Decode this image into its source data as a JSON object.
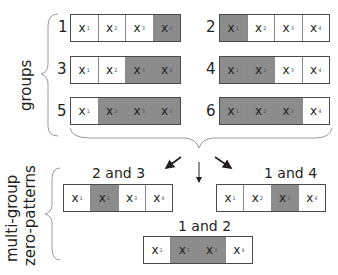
{
  "colors": {
    "zero_cell": "#8c8c8c",
    "nonzero_cell": "#ffffff",
    "border": "#4a4a4a",
    "text": "#231f20"
  },
  "labels": {
    "groups": "groups",
    "multi_group_line1": "multi-group",
    "multi_group_line2": "zero-patterns"
  },
  "variables": [
    {
      "base": "x",
      "sub": "1"
    },
    {
      "base": "x",
      "sub": "2"
    },
    {
      "base": "x",
      "sub": "3"
    },
    {
      "base": "x",
      "sub": "4"
    }
  ],
  "groups": [
    {
      "number": "1",
      "zero": [
        false,
        false,
        false,
        true
      ]
    },
    {
      "number": "2",
      "zero": [
        true,
        false,
        false,
        false
      ]
    },
    {
      "number": "3",
      "zero": [
        false,
        false,
        true,
        true
      ]
    },
    {
      "number": "4",
      "zero": [
        true,
        true,
        false,
        false
      ]
    },
    {
      "number": "5",
      "zero": [
        false,
        true,
        true,
        true
      ]
    },
    {
      "number": "6",
      "zero": [
        true,
        true,
        true,
        false
      ]
    }
  ],
  "patterns": [
    {
      "label": "2 and 3",
      "zero": [
        false,
        true,
        false,
        false
      ]
    },
    {
      "label": "1 and 4",
      "zero": [
        false,
        false,
        true,
        false
      ]
    },
    {
      "label": "1 and 2",
      "zero": [
        false,
        true,
        true,
        false
      ]
    }
  ]
}
